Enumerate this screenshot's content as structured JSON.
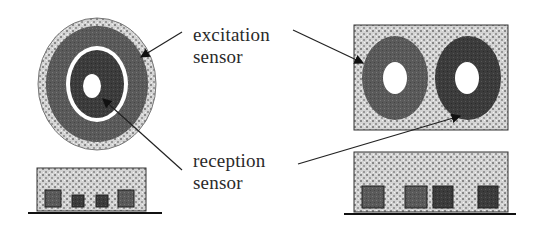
{
  "diagram": {
    "labels": {
      "excitation": [
        "excitation",
        "sensor"
      ],
      "reception": [
        "reception",
        "sensor"
      ]
    },
    "left_sensor": {
      "shape": "concentric-circular",
      "bottom_elements": 4
    },
    "right_sensor": {
      "shape": "side-by-side-rings",
      "rings": 2,
      "bottom_elements": 4
    },
    "colors": {
      "pattern_light": "#c8c8c8",
      "excitation_ring": "#5e5e5e",
      "reception_ring": "#3f3f3f",
      "white_gap": "#ffffff",
      "line": "#222222"
    }
  }
}
